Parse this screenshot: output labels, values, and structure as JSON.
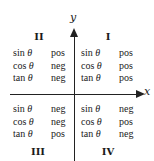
{
  "axes": {
    "x_label": "x",
    "y_label": "y"
  },
  "quadrants": [
    {
      "id": "I",
      "label": "I",
      "rows": [
        {
          "fn": "sin",
          "var": "θ",
          "sign": "pos"
        },
        {
          "fn": "cos",
          "var": "θ",
          "sign": "pos"
        },
        {
          "fn": "tan",
          "var": "θ",
          "sign": "pos"
        }
      ]
    },
    {
      "id": "II",
      "label": "II",
      "rows": [
        {
          "fn": "sin",
          "var": "θ",
          "sign": "pos"
        },
        {
          "fn": "cos",
          "var": "θ",
          "sign": "neg"
        },
        {
          "fn": "tan",
          "var": "θ",
          "sign": "neg"
        }
      ]
    },
    {
      "id": "III",
      "label": "III",
      "rows": [
        {
          "fn": "sin",
          "var": "θ",
          "sign": "neg"
        },
        {
          "fn": "cos",
          "var": "θ",
          "sign": "neg"
        },
        {
          "fn": "tan",
          "var": "θ",
          "sign": "pos"
        }
      ]
    },
    {
      "id": "IV",
      "label": "IV",
      "rows": [
        {
          "fn": "sin",
          "var": "θ",
          "sign": "neg"
        },
        {
          "fn": "cos",
          "var": "θ",
          "sign": "pos"
        },
        {
          "fn": "tan",
          "var": "θ",
          "sign": "neg"
        }
      ]
    }
  ]
}
